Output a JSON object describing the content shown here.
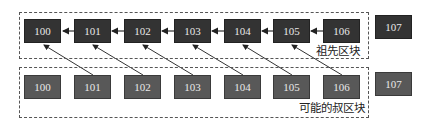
{
  "diagram": {
    "ancestor_group": {
      "label": "祖先区块",
      "blocks": [
        "100",
        "101",
        "102",
        "103",
        "104",
        "105",
        "106"
      ]
    },
    "next_block_top": "107",
    "uncle_group": {
      "label": "可能的叔区块",
      "blocks": [
        "100",
        "101",
        "102",
        "103",
        "104",
        "105",
        "106"
      ]
    },
    "next_block_bottom": "107",
    "colors": {
      "ancestor_block": "#333333",
      "uncle_block": "#585858",
      "block_text": "#e8e8e8",
      "dashed_border": "#555555",
      "arrow": "#222222"
    }
  }
}
